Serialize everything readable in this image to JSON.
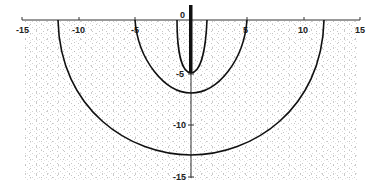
{
  "diagram": {
    "type": "contour-semicircles",
    "x_axis": {
      "range": [
        -15,
        15
      ],
      "ticks": [
        -15,
        -10,
        -5,
        0,
        5,
        10,
        15
      ],
      "tick_labels": [
        "-15",
        "-10",
        "-5",
        "0",
        "5",
        "10",
        "15"
      ]
    },
    "y_axis": {
      "range": [
        -15,
        0
      ],
      "ticks": [
        0,
        -5,
        -10,
        -15
      ],
      "tick_labels": [
        "0",
        "-5",
        "-10",
        "-15"
      ]
    },
    "curves": [
      {
        "name": "inner",
        "half_width": 1.5,
        "depth": -5
      },
      {
        "name": "middle",
        "half_width": 5,
        "depth": -7
      },
      {
        "name": "outer",
        "half_width": 12,
        "depth": -13
      }
    ],
    "source_bar": {
      "x": 0,
      "from_y": 1.5,
      "to_y": -5
    },
    "colors": {
      "line": "#111111",
      "stipple": "#9a9a9a",
      "background": "#ffffff"
    }
  }
}
